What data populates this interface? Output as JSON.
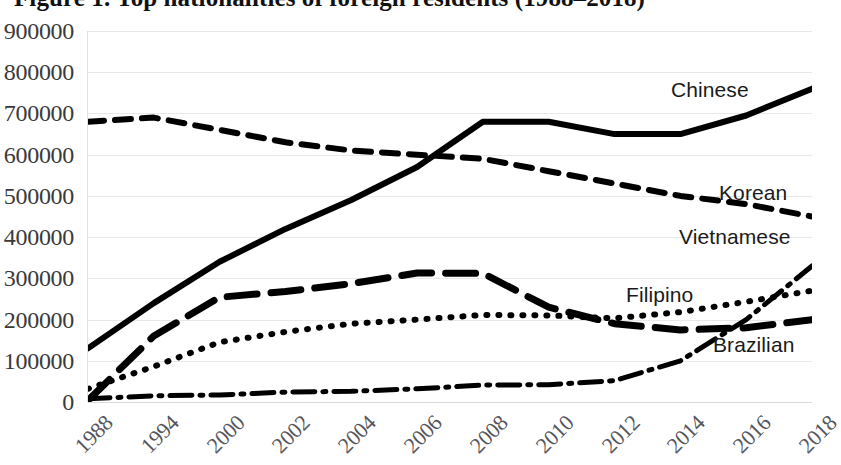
{
  "chart_data": {
    "type": "line",
    "title": "Figure 1. Top nationalities of foreign residents (1988–2018)",
    "xlabel": "",
    "ylabel": "",
    "ylim": [
      0,
      900000
    ],
    "ytick_step": 100000,
    "yticks": [
      "0",
      "100000",
      "200000",
      "300000",
      "400000",
      "500000",
      "600000",
      "700000",
      "800000",
      "900000"
    ],
    "grid": true,
    "legend": "inline-right-labels",
    "categories": [
      "1988",
      "1994",
      "2000",
      "2002",
      "2004",
      "2006",
      "2008",
      "2010",
      "2012",
      "2014",
      "2016",
      "2018"
    ],
    "series": [
      {
        "name": "Chinese",
        "style": "solid",
        "color": "#000000",
        "values": [
          130000,
          240000,
          340000,
          420000,
          490000,
          570000,
          680000,
          680000,
          650000,
          650000,
          695000,
          760000
        ]
      },
      {
        "name": "Korean",
        "style": "dashed",
        "color": "#000000",
        "values": [
          680000,
          690000,
          660000,
          630000,
          610000,
          600000,
          590000,
          560000,
          530000,
          500000,
          480000,
          450000
        ]
      },
      {
        "name": "Vietnamese",
        "style": "dash-dot",
        "color": "#000000",
        "values": [
          8000,
          15000,
          17000,
          24000,
          26000,
          32000,
          41000,
          42000,
          52000,
          100000,
          200000,
          330000
        ]
      },
      {
        "name": "Filipino",
        "style": "dotted",
        "color": "#000000",
        "values": [
          32000,
          86000,
          145000,
          170000,
          190000,
          200000,
          211000,
          210000,
          203000,
          218000,
          243000,
          270000
        ]
      },
      {
        "name": "Brazilian",
        "style": "long-dash",
        "color": "#000000",
        "values": [
          4000,
          160000,
          254000,
          268000,
          287000,
          313000,
          312000,
          230000,
          190000,
          175000,
          180000,
          200000
        ]
      }
    ],
    "series_label_positions": [
      {
        "name": "Chinese",
        "x": 671,
        "y": 78
      },
      {
        "name": "Korean",
        "x": 719,
        "y": 181
      },
      {
        "name": "Vietnamese",
        "x": 679,
        "y": 225
      },
      {
        "name": "Filipino",
        "x": 626,
        "y": 283
      },
      {
        "name": "Brazilian",
        "x": 713,
        "y": 333
      }
    ]
  }
}
